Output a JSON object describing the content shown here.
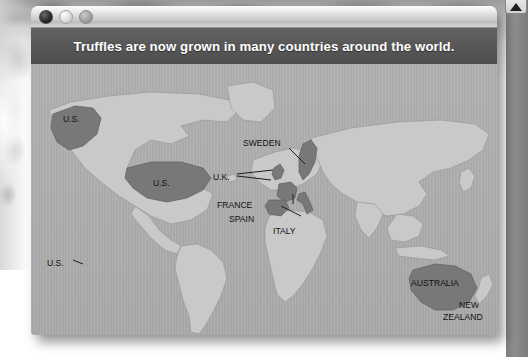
{
  "window": {
    "controls": [
      {
        "name": "close",
        "label": "Close"
      },
      {
        "name": "minimize",
        "label": "Minimize"
      },
      {
        "name": "zoom",
        "label": "Zoom"
      }
    ],
    "banner_title": "Truffles are now grown in many countries around the world."
  },
  "scrollbar": {
    "up_arrow": "▲"
  },
  "map": {
    "highlight_color": "#787878",
    "land_color": "#c9c9c9",
    "ocean_color": "#a9a9a9",
    "labels": [
      {
        "text": "U.S.",
        "region": "alaska"
      },
      {
        "text": "U.S.",
        "region": "continental-us"
      },
      {
        "text": "U.S.",
        "region": "hawaii"
      },
      {
        "text": "SWEDEN",
        "region": "sweden"
      },
      {
        "text": "U.K.",
        "region": "united-kingdom"
      },
      {
        "text": "FRANCE",
        "region": "france"
      },
      {
        "text": "SPAIN",
        "region": "spain"
      },
      {
        "text": "ITALY",
        "region": "italy"
      },
      {
        "text": "AUSTRALIA",
        "region": "australia"
      },
      {
        "text": "NEW",
        "region": "new-zealand-line1"
      },
      {
        "text": "ZEALAND",
        "region": "new-zealand-line2"
      }
    ]
  }
}
